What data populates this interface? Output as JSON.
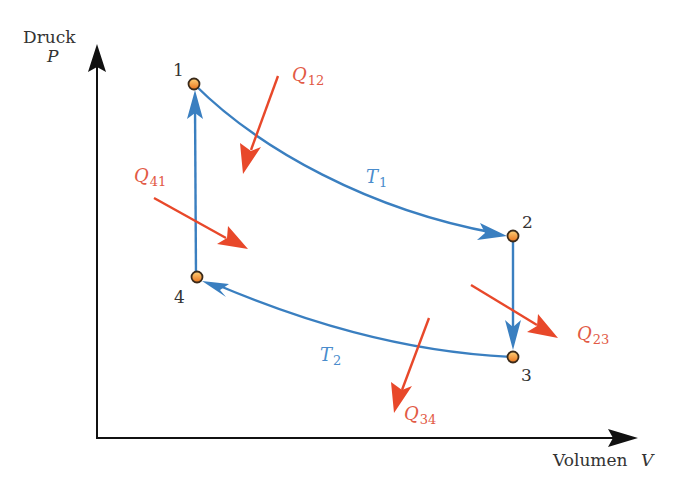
{
  "axes": {
    "y_label": "Druck",
    "y_symbol": "P",
    "x_label": "Volumen",
    "x_symbol": "V"
  },
  "points": [
    {
      "label": "1",
      "x": 194,
      "y": 84
    },
    {
      "label": "2",
      "x": 513,
      "y": 236
    },
    {
      "label": "3",
      "x": 513,
      "y": 357
    },
    {
      "label": "4",
      "x": 197,
      "y": 277
    }
  ],
  "isotherms": [
    {
      "symbol": "T",
      "sub": "1"
    },
    {
      "symbol": "T",
      "sub": "2"
    }
  ],
  "heat_flows": [
    {
      "symbol": "Q",
      "sub": "12"
    },
    {
      "symbol": "Q",
      "sub": "23"
    },
    {
      "symbol": "Q",
      "sub": "34"
    },
    {
      "symbol": "Q",
      "sub": "41"
    }
  ],
  "colors": {
    "process": "#3a7fc0",
    "heat": "#e8482a",
    "heat_label": "#e25a45",
    "point_fill": "#f39a35",
    "point_stroke": "#3a2a1a",
    "axis": "#111111"
  }
}
